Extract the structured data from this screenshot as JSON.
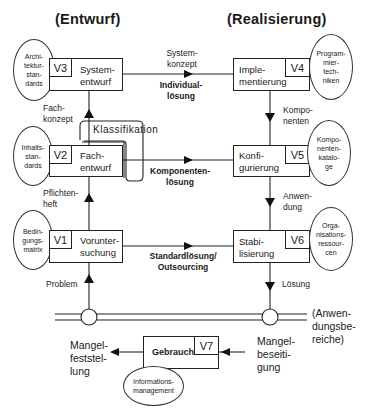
{
  "headings": {
    "left": "(Entwurf)",
    "right": "(Realisierung)"
  },
  "left_column": {
    "boxes": [
      {
        "tag": "V3",
        "label": "System-\nentwurf",
        "resource": "Archi-\ntektur-\nstan-\ndards"
      },
      {
        "tag": "V2",
        "label": "Fach-\nentwurf",
        "resource": "Inhalts-\nstan-\ndards"
      },
      {
        "tag": "V1",
        "label": "Vorunter-\nsuchung",
        "resource": "Bedin-\ngungs-\nmatrix"
      }
    ],
    "flow_labels": {
      "v2_to_v3": "Fach-\nkonzept",
      "v1_to_v2": "Pflichten-\nheft",
      "problem": "Problem"
    }
  },
  "right_column": {
    "boxes": [
      {
        "tag": "V4",
        "label": "Imple-\nmentierung",
        "resource": "Program-\nmier-\ntech-\nniken"
      },
      {
        "tag": "V5",
        "label": "Konfi-\ngurierung",
        "resource": "Kompo-\nnenten-\nkatalo-\nge"
      },
      {
        "tag": "V6",
        "label": "Stabi-\nlisierung",
        "resource": "Orga-\nnisations-\nressour-\ncen"
      }
    ],
    "flow_labels": {
      "v4_to_v5": "Kompo-\nnenten",
      "v5_to_v6": "Anwen-\ndung",
      "solution": "Lösung"
    }
  },
  "horizontal_flows": [
    {
      "top_label": "System-\nkonzept",
      "bottom_label": "Individual-\nlösung"
    },
    {
      "bottom_label": "Komponenten-\nlösung"
    },
    {
      "bottom_label": "Standardlösung/\nOutsourcing"
    }
  ],
  "classification_label": "Klassifikation",
  "application_areas_label": "(Anwen-\ndungsbe-\nreiche)",
  "usage": {
    "tag": "V7",
    "label": "Gebrauch",
    "resource": "Informations-\nmanagement",
    "left_label": "Mangel-\nfeststel-\nlung",
    "right_label": "Mangel-\nbeseiti-\ngung"
  },
  "colors": {
    "line": "#222222",
    "background": "#ffffff",
    "text": "#1a1a1a"
  }
}
